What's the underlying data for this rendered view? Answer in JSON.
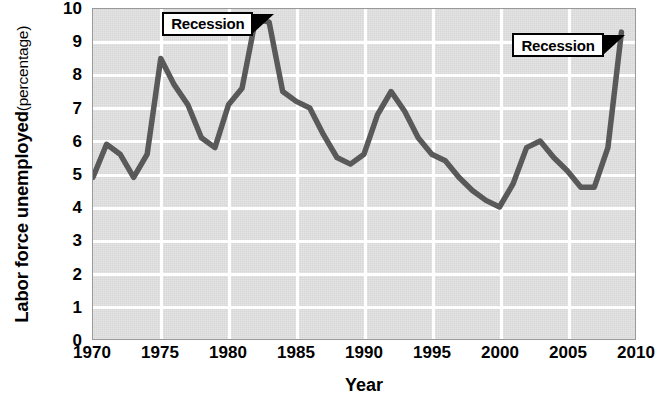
{
  "chart_data": {
    "type": "line",
    "title": "",
    "xlabel": "Year",
    "ylabel": "Labor force unemployed (percentage)",
    "ylabel_main": "Labor force unemployed",
    "ylabel_sub": "(percentage)",
    "xlim": [
      1970,
      2010
    ],
    "ylim": [
      0,
      10
    ],
    "grid": true,
    "legend": "none",
    "x_ticks": [
      1970,
      1975,
      1980,
      1985,
      1990,
      1995,
      2000,
      2005,
      2010
    ],
    "x_tick_labels": [
      "1970",
      "1975",
      "1980",
      "1985",
      "1990",
      "1995",
      "2000",
      "2005",
      "2010"
    ],
    "y_ticks": [
      0,
      1,
      2,
      3,
      4,
      5,
      6,
      7,
      8,
      9,
      10
    ],
    "y_tick_labels": [
      "0",
      "1",
      "2",
      "3",
      "4",
      "5",
      "6",
      "7",
      "8",
      "9",
      "10"
    ],
    "series": [
      {
        "name": "Labor force unemployed",
        "color": "#595959",
        "x": [
          1970,
          1971,
          1972,
          1973,
          1974,
          1975,
          1976,
          1977,
          1978,
          1979,
          1980,
          1981,
          1982,
          1983,
          1984,
          1985,
          1986,
          1987,
          1988,
          1989,
          1990,
          1991,
          1992,
          1993,
          1994,
          1995,
          1996,
          1997,
          1998,
          1999,
          2000,
          2001,
          2002,
          2003,
          2004,
          2005,
          2006,
          2007,
          2008,
          2009
        ],
        "values": [
          4.9,
          5.9,
          5.6,
          4.9,
          5.6,
          8.5,
          7.7,
          7.1,
          6.1,
          5.8,
          7.1,
          7.6,
          9.7,
          9.6,
          7.5,
          7.2,
          7.0,
          6.2,
          5.5,
          5.3,
          5.6,
          6.8,
          7.5,
          6.9,
          6.1,
          5.6,
          5.4,
          4.9,
          4.5,
          4.2,
          4.0,
          4.7,
          5.8,
          6.0,
          5.5,
          5.1,
          4.6,
          4.6,
          5.8,
          9.3
        ]
      }
    ],
    "annotations": [
      {
        "label": "Recession",
        "target_x": 1982,
        "target_y": 9.7
      },
      {
        "label": "Recession",
        "target_x": 2009,
        "target_y": 9.3
      }
    ],
    "colors": {
      "plot_background": "#e0e0e0",
      "gridline": "#ffffff",
      "series_line": "#595959",
      "axis_text": "#000000",
      "plot_border": "#9a9a9a",
      "callout_border": "#000000",
      "callout_fill": "#ffffff",
      "pointer_fill": "#000000"
    }
  }
}
